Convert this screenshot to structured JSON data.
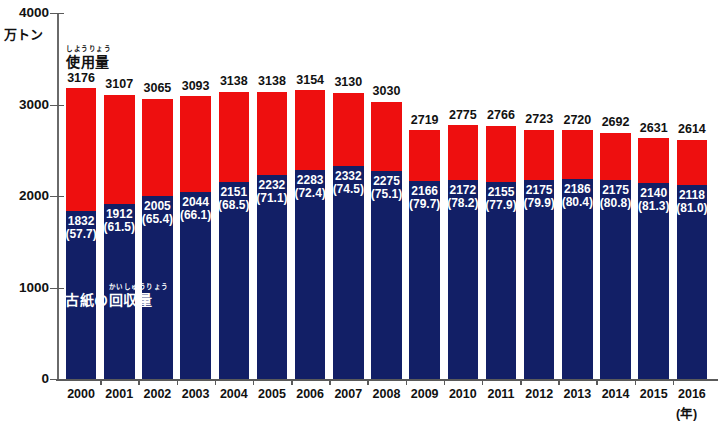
{
  "chart_data": {
    "type": "bar",
    "title": "",
    "subtitle": "",
    "xlabel": "(年)",
    "ylabel": "万トン",
    "ylim": [
      0,
      4000
    ],
    "yticks": [
      0,
      1000,
      2000,
      3000,
      4000
    ],
    "grid": false,
    "stacked": true,
    "legend": "inline-annotation",
    "categories": [
      "2000",
      "2001",
      "2002",
      "2003",
      "2004",
      "2005",
      "2006",
      "2007",
      "2008",
      "2009",
      "2010",
      "2011",
      "2012",
      "2013",
      "2014",
      "2015",
      "2016"
    ],
    "series": [
      {
        "name": "使用量",
        "name_ruby": "しようりょう",
        "color": "#ee0f0f",
        "stack_role": "total",
        "values": [
          3176,
          3107,
          3065,
          3093,
          3138,
          3138,
          3154,
          3130,
          3030,
          2719,
          2775,
          2766,
          2723,
          2720,
          2692,
          2631,
          2614
        ]
      },
      {
        "name": "古紙の回収量",
        "name_ruby": "かいしゅうりょう",
        "color": "#121f66",
        "stack_role": "bottom",
        "values": [
          1832,
          1912,
          2005,
          2044,
          2151,
          2232,
          2283,
          2332,
          2275,
          2166,
          2172,
          2155,
          2175,
          2186,
          2175,
          2140,
          2118
        ],
        "percent_labels": [
          "(57.7)",
          "(61.5)",
          "(65.4)",
          "(66.1)",
          "(68.5)",
          "(71.1)",
          "(72.4)",
          "(74.5)",
          "(75.1)",
          "(79.7)",
          "(78.2)",
          "(77.9)",
          "(79.9)",
          "(80.4)",
          "(80.8)",
          "(81.3)",
          "(81.0)"
        ],
        "percents": [
          57.7,
          61.5,
          65.4,
          66.1,
          68.5,
          71.1,
          72.4,
          74.5,
          75.1,
          79.7,
          78.2,
          77.9,
          79.9,
          80.4,
          80.8,
          81.3,
          81.0
        ]
      }
    ]
  },
  "axes": {
    "y_unit_label": "万トン",
    "y_tick_labels": [
      "4000",
      "3000",
      "2000",
      "1000",
      "0"
    ],
    "x_unit_label": "(年)"
  },
  "annotations": {
    "usage": {
      "ruby": "しようりょう",
      "base": "使用量"
    },
    "recovery": {
      "prefix": "古紙の",
      "ruby": "かいしゅうりょう",
      "base": "回収量"
    }
  },
  "colors": {
    "usage_red": "#ee0f0f",
    "recovery_navy": "#121f66",
    "axis": "#5a5a5a",
    "text": "#111111",
    "label_on_navy": "#ffffff",
    "background": "#ffffff"
  }
}
